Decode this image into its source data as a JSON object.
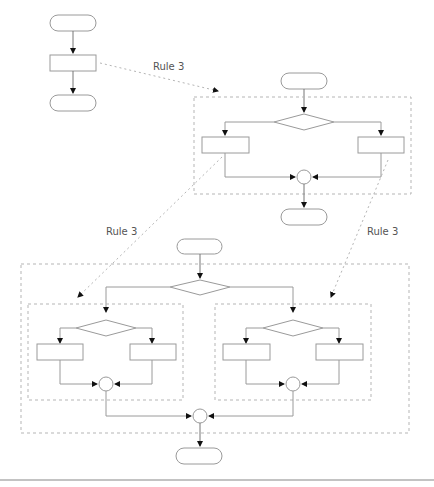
{
  "diagram": {
    "labels": {
      "rule_top": "Rule 3",
      "rule_left": "Rule 3",
      "rule_right": "Rule 3"
    },
    "caption": "",
    "colors": {
      "stroke": "#9a9a9a",
      "dashed": "#b5b5b5",
      "arrow": "#111111",
      "text": "#555555"
    }
  }
}
